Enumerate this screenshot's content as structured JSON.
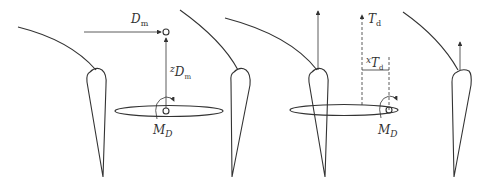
{
  "diagram": {
    "type": "force-moment decomposition on wing/airfoil sections",
    "panels": [
      {
        "id": "drag",
        "labels": {
          "force": "D",
          "force_sub": "m",
          "arm": "z",
          "arm_sub": "D",
          "arm_sub2": "m",
          "moment": "M",
          "moment_sub": "D"
        }
      },
      {
        "id": "thrust",
        "labels": {
          "force": "T",
          "force_sub": "d",
          "arm": "x",
          "arm_sub": "T",
          "arm_sub2": "d",
          "moment": "M",
          "moment_sub": "D"
        }
      }
    ],
    "colors": {
      "stroke": "#333333",
      "background": "#ffffff"
    }
  }
}
